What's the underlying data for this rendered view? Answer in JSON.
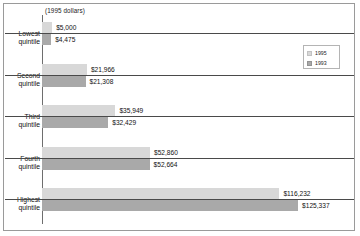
{
  "header": {
    "units_note": "(1995 dollars)"
  },
  "legend": {
    "position": "top-right-inside",
    "entries": [
      {
        "label": "1995",
        "color": "#d8d8d8"
      },
      {
        "label": "1993",
        "color": "#a9a9a9"
      }
    ]
  },
  "chart_data": {
    "type": "bar",
    "orientation": "horizontal",
    "title": "",
    "subtitle": "(1995 dollars)",
    "xlabel": "",
    "ylabel": "",
    "grid": false,
    "axis_ticks_visible": false,
    "xlim": [
      0,
      125337
    ],
    "categories": [
      "Lowest quintile",
      "Second quintile",
      "Third quintile",
      "Fourth quintile",
      "Highest quintile"
    ],
    "category_lines": [
      [
        "Lowest",
        "quintile"
      ],
      [
        "Second",
        "quintile"
      ],
      [
        "Third",
        "quintile"
      ],
      [
        "Fourth",
        "quintile"
      ],
      [
        "Highest",
        "quintile"
      ]
    ],
    "series": [
      {
        "name": "1995",
        "color": "#d8d8d8",
        "values": [
          5000,
          21966,
          35949,
          52860,
          116232
        ],
        "labels": [
          "$5,000",
          "$21,966",
          "$35,949",
          "$52,860",
          "$116,232"
        ]
      },
      {
        "name": "1993",
        "color": "#a9a9a9",
        "values": [
          4475,
          21308,
          32429,
          52664,
          125337
        ],
        "labels": [
          "$4,475",
          "$21,308",
          "$32,429",
          "$52,664",
          "$125,337"
        ]
      }
    ]
  },
  "style": {
    "series_1995_color": "#d8d8d8",
    "series_1993_color": "#a9a9a9",
    "axis_color": "#6e6e6e",
    "separator_color": "#4a4a4a",
    "frame_color": "#9a9a9a",
    "background": "#ffffff"
  }
}
